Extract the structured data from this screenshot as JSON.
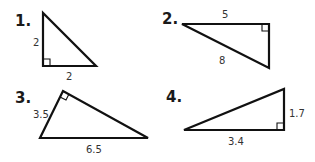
{
  "problems": [
    {
      "number": "1.",
      "labels": [
        "2",
        "2"
      ],
      "sides": {
        "vertical_leg": "2",
        "horizontal_leg": "2"
      }
    },
    {
      "number": "2.",
      "labels": [
        "5",
        "8"
      ],
      "sides": {
        "top_leg": "5",
        "hypotenuse": "8"
      }
    },
    {
      "number": "3.",
      "labels": [
        "3.5",
        "6.5"
      ],
      "sides": {
        "short_leg": "3.5",
        "hypotenuse": "6.5"
      }
    },
    {
      "number": "4.",
      "labels": [
        "1.7",
        "3.4"
      ],
      "sides": {
        "vertical_leg": "1.7",
        "horizontal_leg": "3.4"
      }
    }
  ],
  "colors": {
    "stroke": "#111111",
    "text": "#333333",
    "background": "#ffffff"
  }
}
